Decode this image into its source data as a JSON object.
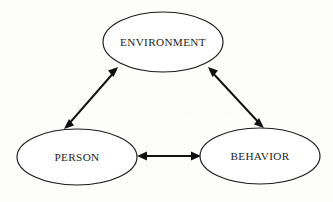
{
  "diagram": {
    "background_color": "#fdfdfc",
    "stroke_color": "#101010",
    "node_fill_color": "#ffffff",
    "text_color": "#232323",
    "nodes": [
      {
        "id": "environment",
        "label": "ENVIRONMENT",
        "cx": 163,
        "cy": 42,
        "rx": 60,
        "ry": 30
      },
      {
        "id": "person",
        "label": "PERSON",
        "cx": 77,
        "cy": 157,
        "rx": 60,
        "ry": 28
      },
      {
        "id": "behavior",
        "label": "BEHAVIOR",
        "cx": 260,
        "cy": 156,
        "rx": 60,
        "ry": 28
      }
    ],
    "connectors": [
      {
        "id": "person-environment",
        "from": "person",
        "to": "environment",
        "style": "double-headed-arrow",
        "x1": 65,
        "y1": 128,
        "x2": 118,
        "y2": 68
      },
      {
        "id": "environment-behavior",
        "from": "environment",
        "to": "behavior",
        "style": "double-headed-arrow",
        "x1": 208,
        "y1": 68,
        "x2": 263,
        "y2": 127
      },
      {
        "id": "person-behavior",
        "from": "person",
        "to": "behavior",
        "style": "double-headed-arrow",
        "x1": 138,
        "y1": 156,
        "x2": 200,
        "y2": 156
      }
    ]
  }
}
